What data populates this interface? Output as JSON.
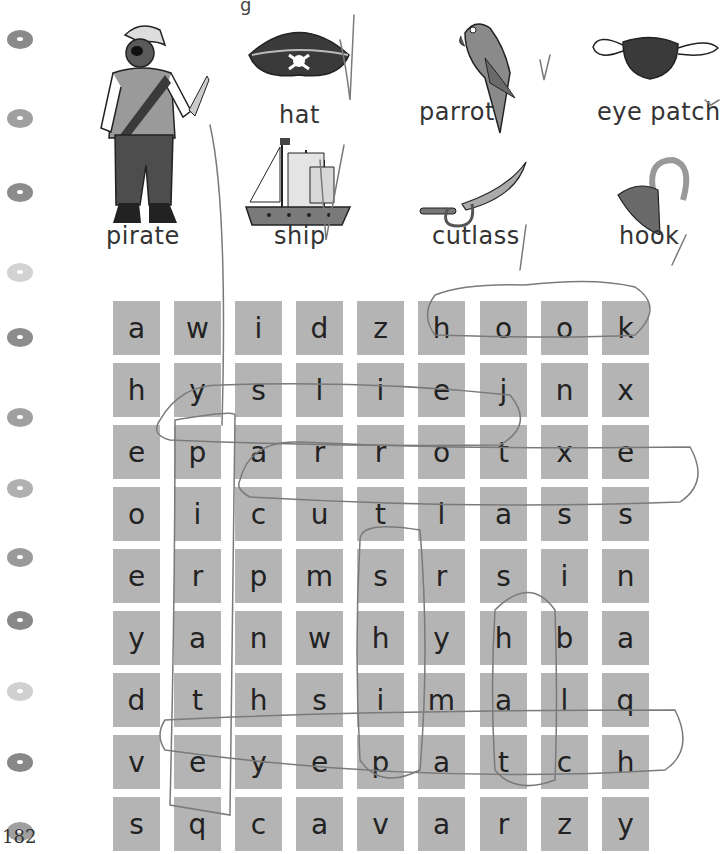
{
  "page": {
    "header_fragment": "g        ",
    "page_number": "182"
  },
  "binder_holes": [
    {
      "y": 17,
      "color": "#8a8a8a"
    },
    {
      "y": 61,
      "color": "#a0a0a0"
    },
    {
      "y": 103,
      "color": "#8c8c8c"
    },
    {
      "y": 148,
      "color": "#d2d2d2"
    },
    {
      "y": 184,
      "color": "#8c8c8c"
    },
    {
      "y": 229,
      "color": "#a0a0a0"
    },
    {
      "y": 269,
      "color": "#b0b0b0"
    },
    {
      "y": 308,
      "color": "#9a9a9a"
    },
    {
      "y": 343,
      "color": "#888888"
    },
    {
      "y": 383,
      "color": "#d0d0d0"
    },
    {
      "y": 423,
      "color": "#888888"
    },
    {
      "y": 462,
      "color": "#a0a0a0"
    }
  ],
  "vocabulary": [
    {
      "word": "pirate",
      "icon": "pirate-icon",
      "checked": true
    },
    {
      "word": "hat",
      "icon": "pirate-hat-icon",
      "checked": true
    },
    {
      "word": "parrot",
      "icon": "parrot-icon",
      "checked": true
    },
    {
      "word": "eye patch",
      "icon": "eye-patch-icon",
      "checked": true
    },
    {
      "word": "ship",
      "icon": "ship-icon",
      "checked": true
    },
    {
      "word": "cutlass",
      "icon": "cutlass-icon",
      "checked": true
    },
    {
      "word": "hook",
      "icon": "hook-icon",
      "checked": true
    }
  ],
  "word_search": {
    "rows": [
      [
        "a",
        "w",
        "i",
        "d",
        "z",
        "h",
        "o",
        "o",
        "k"
      ],
      [
        "h",
        "y",
        "s",
        "l",
        "i",
        "e",
        "j",
        "n",
        "x"
      ],
      [
        "e",
        "p",
        "a",
        "r",
        "r",
        "o",
        "t",
        "x",
        "e"
      ],
      [
        "o",
        "i",
        "c",
        "u",
        "t",
        "l",
        "a",
        "s",
        "s"
      ],
      [
        "e",
        "r",
        "p",
        "m",
        "s",
        "r",
        "s",
        "i",
        "n"
      ],
      [
        "y",
        "a",
        "n",
        "w",
        "h",
        "y",
        "h",
        "b",
        "a"
      ],
      [
        "d",
        "t",
        "h",
        "s",
        "i",
        "m",
        "a",
        "l",
        "q"
      ],
      [
        "v",
        "e",
        "y",
        "e",
        "p",
        "a",
        "t",
        "c",
        "h"
      ],
      [
        "s",
        "q",
        "c",
        "a",
        "v",
        "a",
        "r",
        "z",
        "y"
      ]
    ],
    "circled_words": [
      {
        "word": "hook",
        "direction": "horizontal",
        "row": 0,
        "col_start": 5,
        "col_end": 8
      },
      {
        "word": "parrot",
        "direction": "horizontal",
        "row": 2,
        "col_start": 1,
        "col_end": 6
      },
      {
        "word": "cutlass",
        "direction": "horizontal",
        "row": 3,
        "col_start": 2,
        "col_end": 8
      },
      {
        "word": "pirate",
        "direction": "vertical",
        "col": 1,
        "row_start": 2,
        "row_end": 7
      },
      {
        "word": "ship",
        "direction": "vertical",
        "col": 4,
        "row_start": 4,
        "row_end": 7
      },
      {
        "word": "hat",
        "direction": "vertical",
        "col": 6,
        "row_start": 5,
        "row_end": 7
      },
      {
        "word": "eyepatch",
        "direction": "horizontal",
        "row": 7,
        "col_start": 1,
        "col_end": 8
      }
    ],
    "cell_color": "#b4b4b4",
    "pencil_color": "#7a7a7a"
  }
}
